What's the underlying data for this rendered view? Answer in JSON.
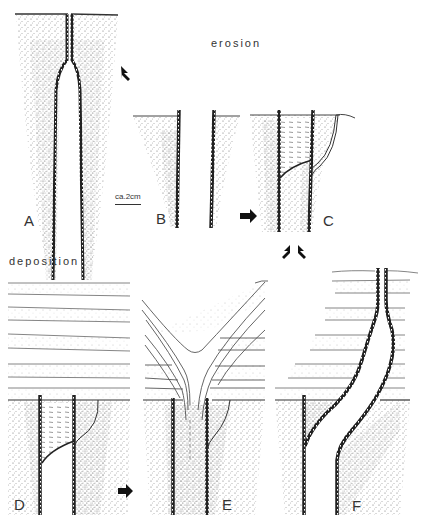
{
  "figure": {
    "headings": {
      "erosion": "erosion",
      "deposition": "deposition"
    },
    "scale_bar": {
      "label": "ca.2cm"
    },
    "panels": [
      {
        "id": "A",
        "label": "A",
        "description": "initial burrow with funnel opening at surface"
      },
      {
        "id": "B",
        "label": "B",
        "description": "burrow truncated by erosion"
      },
      {
        "id": "C",
        "label": "C",
        "description": "eroded burrow with fill and new tube"
      },
      {
        "id": "D",
        "label": "D",
        "description": "deposition of layered sediment over filled burrow"
      },
      {
        "id": "E",
        "label": "E",
        "description": "V-shaped collapse structure of layers"
      },
      {
        "id": "F",
        "label": "F",
        "description": "upward-extended burrow through deposited layers"
      }
    ],
    "arrows": [
      {
        "from": "A",
        "to": "B",
        "direction": "down-right"
      },
      {
        "from": "B",
        "to": "C",
        "direction": "right"
      },
      {
        "from": "C",
        "to": "D",
        "direction": "down-left"
      },
      {
        "from": "C",
        "to": "F",
        "direction": "down-right"
      },
      {
        "from": "D",
        "to": "E",
        "direction": "right"
      }
    ]
  }
}
